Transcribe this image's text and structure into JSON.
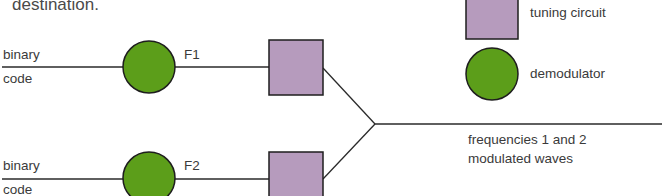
{
  "caption": "destination.",
  "inputs": [
    {
      "label_line1": "binary",
      "label_line2": "code",
      "frequency": "F1"
    },
    {
      "label_line1": "binary",
      "label_line2": "code",
      "frequency": "F2"
    }
  ],
  "output": {
    "line1": "frequencies 1 and 2",
    "line2": "modulated waves"
  },
  "legend": [
    {
      "shape": "square",
      "label": "tuning circuit"
    },
    {
      "shape": "circle",
      "label": "demodulator"
    }
  ],
  "colors": {
    "demodulator_fill": "#5c9e1a",
    "tuning_fill": "#b69bbd",
    "stroke": "#1e1e1e"
  }
}
